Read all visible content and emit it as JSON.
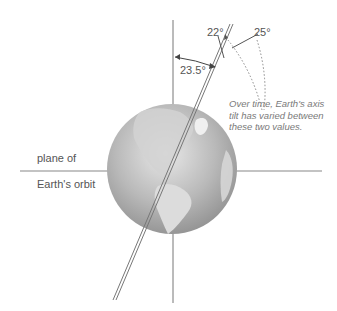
{
  "diagram": {
    "labels": {
      "tilt_current": "23.5°",
      "tilt_min": "22°",
      "tilt_max": "25°",
      "plane_line1": "plane of",
      "plane_line2": "Earth's orbit",
      "note": "Over time, Earth's axis tilt has varied between these two values."
    },
    "colors": {
      "line": "#777777",
      "globe_light": "#e4e4e4",
      "globe_dark": "#8a8a8a",
      "land": "#d8d8d8",
      "text": "#555555"
    }
  }
}
